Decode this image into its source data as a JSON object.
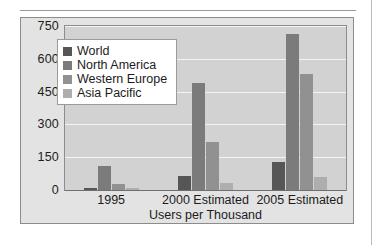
{
  "chart_data": {
    "type": "bar",
    "title": "",
    "subtitle": "",
    "xlabel": "Users per Thousand",
    "ylabel": "",
    "categories": [
      "1995",
      "2000 Estimated",
      "2005 Estimated"
    ],
    "series": [
      {
        "name": "World",
        "color": "#565656",
        "values": [
          10,
          65,
          130
        ]
      },
      {
        "name": "North America",
        "color": "#7b7b7b",
        "values": [
          110,
          490,
          715
        ]
      },
      {
        "name": "Western Europe",
        "color": "#919191",
        "values": [
          28,
          220,
          530
        ]
      },
      {
        "name": "Asia Pacific",
        "color": "#aeaeae",
        "values": [
          8,
          30,
          60
        ]
      }
    ],
    "ylim": [
      0,
      750
    ],
    "yticks": [
      0,
      150,
      300,
      450,
      600,
      750
    ],
    "ytick_labels": [
      "0",
      "150",
      "300",
      "450",
      "600",
      "750"
    ],
    "grid": true,
    "grid_color": "#f4f4f4",
    "legend_position": "upper-left-inside",
    "plot_background": "#d2d2d2",
    "figure_background": "#e3e3e3",
    "axis_color": "#8c8c8c",
    "text_color": "#1c1c1c"
  }
}
